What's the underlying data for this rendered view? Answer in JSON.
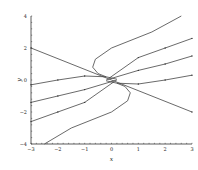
{
  "chart_data": {
    "type": "line",
    "title": "",
    "xlabel": "x",
    "ylabel": "y",
    "xlim": [
      -3,
      3
    ],
    "ylim": [
      -4,
      4
    ],
    "xticks": [
      "-3",
      "-2",
      "-1",
      "0",
      "1",
      "2",
      "3"
    ],
    "yticks": [
      "-4",
      "-2",
      "0",
      "2",
      "4"
    ],
    "grid": false,
    "series": [
      {
        "name": "line",
        "x": [
          -3,
          3
        ],
        "y": [
          2,
          -2
        ]
      },
      {
        "name": "curve-upper",
        "x": [
          2.6,
          1.5,
          0,
          -0.6,
          -0.7,
          -0.5,
          -0.2,
          0.2
        ],
        "y": [
          4,
          3,
          2,
          1.3,
          0.8,
          0.4,
          0.2,
          0.05
        ]
      },
      {
        "name": "curve-lower",
        "x": [
          -2.5,
          -1.5,
          0,
          0.6,
          0.7,
          0.5,
          0.2,
          -0.2
        ],
        "y": [
          -4,
          -3,
          -2,
          -1.3,
          -0.8,
          -0.4,
          -0.2,
          -0.05
        ]
      },
      {
        "name": "traj-1",
        "x": [
          -0.1,
          1,
          2,
          3
        ],
        "y": [
          0.1,
          1.4,
          2,
          2.6
        ]
      },
      {
        "name": "traj-2",
        "x": [
          -0.2,
          1,
          2,
          3
        ],
        "y": [
          0.0,
          0.6,
          1,
          1.5
        ]
      },
      {
        "name": "traj-3",
        "x": [
          0.2,
          1,
          2,
          3
        ],
        "y": [
          -0.2,
          -0.25,
          0,
          0.3
        ]
      },
      {
        "name": "traj-4",
        "x": [
          -3,
          -2,
          -1,
          -0.2
        ],
        "y": [
          -0.3,
          0,
          0.25,
          0.2
        ]
      },
      {
        "name": "traj-5",
        "x": [
          -3,
          -2,
          -1,
          0.2
        ],
        "y": [
          -1.4,
          -1,
          -0.6,
          0
        ]
      },
      {
        "name": "traj-6",
        "x": [
          -3,
          -2,
          -1,
          0.1
        ],
        "y": [
          -2.6,
          -2,
          -1.4,
          -0.1
        ]
      }
    ]
  }
}
